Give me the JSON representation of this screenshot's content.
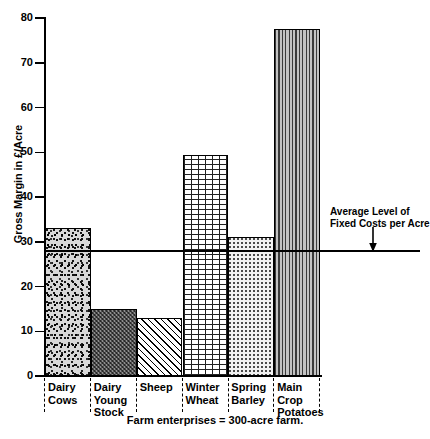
{
  "chart_data": {
    "type": "bar",
    "title": "",
    "subtitle": "",
    "xlabel": "Farm enterprises = 300-acre farm.",
    "ylabel": "Gross Margin in £/Acre",
    "categories": [
      "Dairy\nCows",
      "Dairy\nYoung\nStock",
      "Sheep",
      "Winter\nWheat",
      "Spring\nBarley",
      "Main\nCrop\nPotatoes"
    ],
    "values": [
      33,
      15,
      13,
      49.5,
      31,
      77.5
    ],
    "ylim": [
      0,
      80
    ],
    "yticks": [
      0,
      10,
      20,
      30,
      40,
      50,
      60,
      70,
      80
    ],
    "ytick_labels": [
      "0",
      "10",
      "20",
      "30",
      "40",
      "50",
      "60",
      "70",
      "80"
    ],
    "grid": false,
    "legend": "none",
    "annotations": [
      {
        "name": "average-fixed-costs",
        "text_line_1": "Average Level of",
        "text_line_2": "Fixed Costs per Acre",
        "value": 28,
        "type": "horizontal-reference-line"
      }
    ],
    "bar_patterns": [
      "stipple",
      "crosshatch",
      "diagonal-hatch",
      "brick",
      "fine-dots",
      "vertical-lines"
    ]
  },
  "axis": {
    "y_title": "Gross Margin in £/Acre",
    "caption": "Farm enterprises = 300-acre farm."
  },
  "annotation": {
    "line1": "Average Level of",
    "line2": "Fixed Costs per Acre"
  },
  "colors": {
    "ink": "#000000",
    "paper": "#ffffff",
    "stipple_fill": "#d8d8d8",
    "crosshatch_fill": "#8e8e8e",
    "dots_fill": "#f2f2f2",
    "vlines_fill": "#9a9a9a"
  }
}
